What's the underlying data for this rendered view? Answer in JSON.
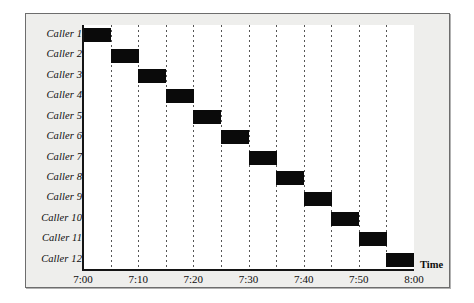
{
  "chart_data": {
    "type": "bar",
    "orientation": "horizontal",
    "title": "",
    "xlabel": "Time",
    "ylabel": "",
    "grid": true,
    "legend": null,
    "xlim": [
      "7:00",
      "8:00"
    ],
    "xtick_labels": [
      "7:00",
      "7:10",
      "7:20",
      "7:30",
      "7:40",
      "7:50",
      "8:00"
    ],
    "xtick_minutes": [
      0,
      10,
      20,
      30,
      40,
      50,
      60
    ],
    "gridline_minutes": [
      5,
      10,
      15,
      20,
      25,
      30,
      35,
      40,
      45,
      50,
      55
    ],
    "categories": [
      "Caller 1",
      "Caller 2",
      "Caller 3",
      "Caller 4",
      "Caller 5",
      "Caller 6",
      "Caller 7",
      "Caller 8",
      "Caller 9",
      "Caller 10",
      "Caller 11",
      "Caller 12"
    ],
    "bars": [
      {
        "label": "Caller 1",
        "start": "7:00",
        "end": "7:05",
        "start_min": 0,
        "duration_min": 5
      },
      {
        "label": "Caller 2",
        "start": "7:05",
        "end": "7:10",
        "start_min": 5,
        "duration_min": 5
      },
      {
        "label": "Caller 3",
        "start": "7:10",
        "end": "7:15",
        "start_min": 10,
        "duration_min": 5
      },
      {
        "label": "Caller 4",
        "start": "7:15",
        "end": "7:20",
        "start_min": 15,
        "duration_min": 5
      },
      {
        "label": "Caller 5",
        "start": "7:20",
        "end": "7:25",
        "start_min": 20,
        "duration_min": 5
      },
      {
        "label": "Caller 6",
        "start": "7:25",
        "end": "7:30",
        "start_min": 25,
        "duration_min": 5
      },
      {
        "label": "Caller 7",
        "start": "7:30",
        "end": "7:35",
        "start_min": 30,
        "duration_min": 5
      },
      {
        "label": "Caller 8",
        "start": "7:35",
        "end": "7:40",
        "start_min": 35,
        "duration_min": 5
      },
      {
        "label": "Caller 9",
        "start": "7:40",
        "end": "7:45",
        "start_min": 40,
        "duration_min": 5
      },
      {
        "label": "Caller 10",
        "start": "7:45",
        "end": "7:50",
        "start_min": 45,
        "duration_min": 5
      },
      {
        "label": "Caller 11",
        "start": "7:50",
        "end": "7:55",
        "start_min": 50,
        "duration_min": 5
      },
      {
        "label": "Caller 12",
        "start": "7:55",
        "end": "8:00",
        "start_min": 55,
        "duration_min": 5
      }
    ],
    "colors": {
      "bar": "#0a0a0a",
      "axis": "#141414",
      "gridline": "#555555",
      "plot_background": "#ffffff",
      "panel_background": "#eeeeec",
      "text": "#0d0d0d"
    }
  }
}
